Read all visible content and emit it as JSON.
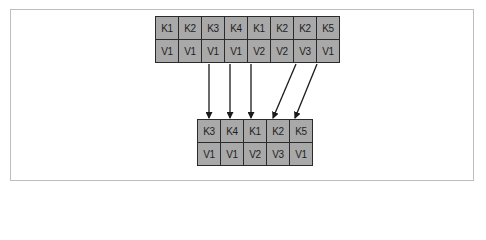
{
  "diagram": {
    "title": "",
    "source_table": {
      "keys": [
        "K1",
        "K2",
        "K3",
        "K4",
        "K1",
        "K2",
        "K2",
        "K5"
      ],
      "values": [
        "V1",
        "V1",
        "V1",
        "V1",
        "V2",
        "V2",
        "V3",
        "V1"
      ]
    },
    "result_table": {
      "keys": [
        "K3",
        "K4",
        "K1",
        "K2",
        "K5"
      ],
      "values": [
        "V1",
        "V1",
        "V2",
        "V3",
        "V1"
      ]
    },
    "arrows": [
      {
        "from_index": 2,
        "to_index": 0
      },
      {
        "from_index": 3,
        "to_index": 1
      },
      {
        "from_index": 4,
        "to_index": 2
      },
      {
        "from_index": 6,
        "to_index": 3
      },
      {
        "from_index": 7,
        "to_index": 4
      }
    ],
    "colors": {
      "cell_fill": "#a9a9a9",
      "cell_border": "#2b2b2b",
      "arrow": "#1a1a1a",
      "frame": "#bdbdbd"
    }
  }
}
